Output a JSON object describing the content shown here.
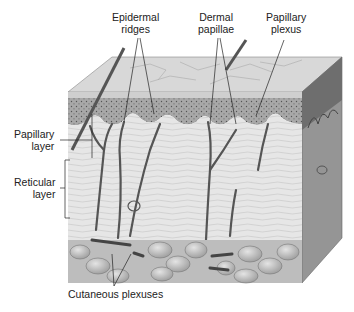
{
  "diagram": {
    "labels": {
      "epidermal_ridges": [
        "Epidermal",
        "ridges"
      ],
      "dermal_papillae": [
        "Dermal",
        "papillae"
      ],
      "papillary_plexus": [
        "Papillary",
        "plexus"
      ],
      "papillary_layer": [
        "Papillary",
        "layer"
      ],
      "reticular_layer": [
        "Reticular",
        "layer"
      ],
      "cutaneous_plexuses": "Cutaneous plexuses"
    },
    "colors": {
      "background": "#ffffff",
      "skin_top": "#d6d6d6",
      "epidermis": "#9a9a9a",
      "dermis": "#e8e8e8",
      "right_face": "#8f8f8f",
      "fat": "#bdbdbd",
      "vessel": "#555555",
      "label_text": "#222222",
      "leader_line": "#222222"
    }
  }
}
